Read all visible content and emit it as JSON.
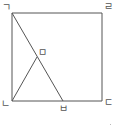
{
  "diagram": {
    "type": "geometry-figure",
    "shape": "square",
    "points": {
      "giyeok": {
        "label": "ㄱ",
        "x": 12,
        "y": 13
      },
      "rieul": {
        "label": "ㄹ",
        "x": 102,
        "y": 13
      },
      "nieun": {
        "label": "ㄴ",
        "x": 12,
        "y": 101
      },
      "digeut": {
        "label": "ㄷ",
        "x": 102,
        "y": 101
      },
      "mieum": {
        "label": "ㅁ",
        "x": 37,
        "y": 57
      },
      "bieup": {
        "label": "ㅂ",
        "x": 63,
        "y": 101
      }
    },
    "segments": [
      [
        "ㄱ",
        "ㄹ"
      ],
      [
        "ㄹ",
        "ㄷ"
      ],
      [
        "ㄷ",
        "ㄴ"
      ],
      [
        "ㄴ",
        "ㄱ"
      ],
      [
        "ㄱ",
        "ㅂ"
      ],
      [
        "ㄴ",
        "ㅁ"
      ]
    ],
    "colors": {
      "line": "#555555",
      "background": "#ffffff"
    }
  }
}
